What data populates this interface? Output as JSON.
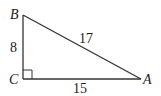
{
  "diagram": {
    "type": "right-triangle",
    "vertices": {
      "B": {
        "label": "B",
        "x": 23,
        "y": 15
      },
      "C": {
        "label": "C",
        "x": 23,
        "y": 79
      },
      "A": {
        "label": "A",
        "x": 141,
        "y": 79
      }
    },
    "sides": {
      "BC": {
        "label": "8"
      },
      "BA": {
        "label": "17"
      },
      "CA": {
        "label": "15"
      }
    },
    "right_angle_at": "C",
    "line_color": "#333333"
  }
}
